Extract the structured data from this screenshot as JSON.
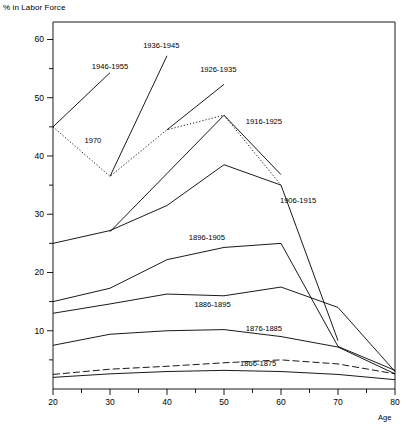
{
  "chart_data": {
    "type": "line",
    "title": "",
    "xlabel": "Age",
    "ylabel": "% in Labor Force",
    "xlim": [
      20,
      80
    ],
    "ylim": [
      0,
      63
    ],
    "xticks": [
      20,
      30,
      40,
      50,
      60,
      70,
      80
    ],
    "xminorticks": [
      25,
      35,
      45,
      55,
      65,
      75
    ],
    "yticks": [
      10,
      20,
      30,
      40,
      50,
      60
    ],
    "yminorticks": [
      5,
      15,
      25,
      35,
      45,
      55
    ],
    "grid": false,
    "legend_position": "inline-labels",
    "series": [
      {
        "name": "1946-1955",
        "style": "solid",
        "label_x": 30,
        "label_y": 55,
        "x": [
          20,
          30
        ],
        "values": [
          45.0,
          54.3
        ]
      },
      {
        "name": "1936-1945",
        "style": "solid",
        "label_x": 39,
        "label_y": 58.5,
        "x": [
          30,
          40
        ],
        "values": [
          36.5,
          57.2
        ]
      },
      {
        "name": "1926-1935",
        "style": "solid",
        "label_x": 49,
        "label_y": 54.5,
        "x": [
          40,
          50
        ],
        "values": [
          44.5,
          52.3
        ]
      },
      {
        "name": "1916-1925",
        "style": "solid",
        "label_x": 57,
        "label_y": 45.5,
        "x": [
          30,
          40,
          50,
          60
        ],
        "values": [
          27.0,
          37.0,
          47.0,
          36.8
        ]
      },
      {
        "name": "1906-1915",
        "style": "solid",
        "label_x": 63,
        "label_y": 32.0,
        "x": [
          20,
          30,
          40,
          50,
          60,
          70
        ],
        "values": [
          25.0,
          27.2,
          31.5,
          38.5,
          35.0,
          8.3
        ]
      },
      {
        "name": "1896-1905",
        "style": "solid",
        "label_x": 47,
        "label_y": 25.5,
        "x": [
          20,
          30,
          40,
          50,
          60,
          70,
          80
        ],
        "values": [
          15.0,
          17.3,
          22.2,
          24.3,
          25.0,
          7.3,
          3.2
        ]
      },
      {
        "name": "1886-1895",
        "style": "solid",
        "label_x": 48,
        "label_y": 14.0,
        "x": [
          20,
          30,
          40,
          50,
          60,
          70,
          80
        ],
        "values": [
          13.0,
          14.6,
          16.3,
          16.0,
          17.5,
          14.0,
          3.0
        ]
      },
      {
        "name": "1876-1885",
        "style": "solid",
        "label_x": 57,
        "label_y": 10.0,
        "x": [
          20,
          30,
          40,
          50,
          60,
          70,
          80
        ],
        "values": [
          7.5,
          9.4,
          10.0,
          10.2,
          9.0,
          7.2,
          2.6
        ]
      },
      {
        "name": "1866-1875",
        "style": "dashed",
        "label_x": 56,
        "label_y": 4.0,
        "x": [
          20,
          30,
          40,
          50,
          60,
          70,
          80
        ],
        "values": [
          2.5,
          3.4,
          3.9,
          4.5,
          5.0,
          4.3,
          2.6
        ]
      },
      {
        "name": "1970",
        "style": "dotted",
        "label_x": 27,
        "label_y": 42.2,
        "x": [
          20,
          30,
          40,
          50,
          60
        ],
        "values": [
          45.0,
          36.5,
          44.5,
          47.0,
          35.0
        ]
      },
      {
        "name": "baseline-lowest",
        "style": "solid",
        "label_x": null,
        "label_y": null,
        "x": [
          20,
          30,
          40,
          50,
          60,
          70,
          80
        ],
        "values": [
          2.0,
          2.6,
          3.0,
          3.2,
          3.0,
          2.5,
          1.6
        ]
      }
    ]
  }
}
